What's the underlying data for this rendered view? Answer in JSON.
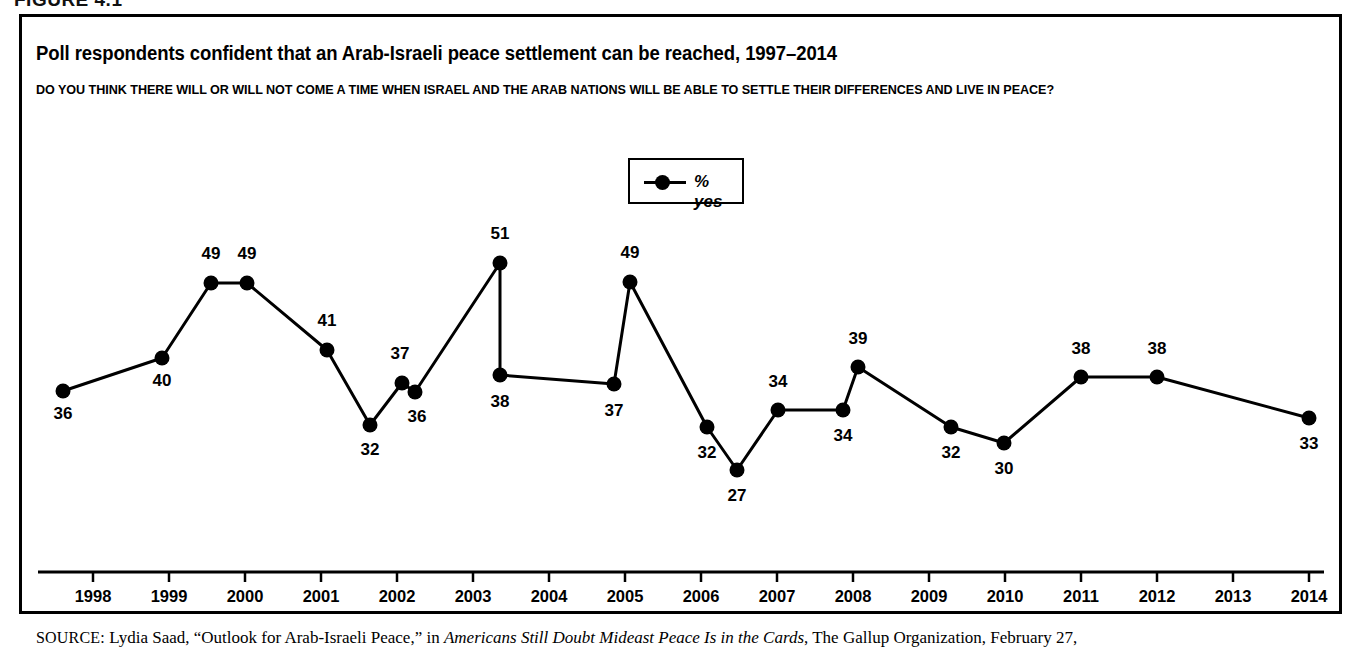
{
  "figure": {
    "caption": "FIGURE 4.1"
  },
  "chart": {
    "title": "Poll respondents confident that an Arab-Israeli peace settlement can be reached, 1997–2014",
    "question": "DO YOU THINK THERE WILL OR WILL NOT COME A TIME WHEN ISRAEL AND THE ARAB NATIONS WILL BE ABLE TO SETTLE THEIR DIFFERENCES AND LIVE IN PEACE?",
    "legend": {
      "label": "% yes",
      "marker": "line-with-dot-marker"
    },
    "colors": {
      "line": "#000000",
      "marker": "#000000",
      "frame": "#000000",
      "background": "#ffffff"
    }
  },
  "source": {
    "label": "SOURCE:",
    "text_before_italic": " Lydia Saad, “Outlook for Arab-Israeli Peace,” in ",
    "italic_text": "Americans Still Doubt Mideast Peace Is in the Cards",
    "text_after_italic": ", The Gallup Organization, February 27,"
  },
  "chart_data": {
    "type": "line",
    "title": "Poll respondents confident that an Arab-Israeli peace settlement can be reached, 1997–2014",
    "subtitle": "DO YOU THINK THERE WILL OR WILL NOT COME A TIME WHEN ISRAEL AND THE ARAB NATIONS WILL BE ABLE TO SETTLE THEIR DIFFERENCES AND LIVE IN PEACE?",
    "xlabel": "",
    "ylabel": "",
    "grid": false,
    "legend_position": "top-center",
    "series": [
      {
        "name": "% yes",
        "values": [
          36,
          40,
          49,
          49,
          41,
          32,
          37,
          36,
          51,
          38,
          37,
          49,
          32,
          27,
          34,
          34,
          39,
          32,
          30,
          38,
          38,
          33
        ]
      }
    ],
    "point_labels": [
      "36",
      "40",
      "49",
      "49",
      "41",
      "32",
      "37",
      "36",
      "51",
      "38",
      "37",
      "49",
      "32",
      "27",
      "34",
      "34",
      "39",
      "32",
      "30",
      "38",
      "38",
      "33"
    ],
    "points": [
      {
        "label": "36",
        "value": 36,
        "x": 63,
        "y": 391,
        "label_dx": 0,
        "label_dy": 22
      },
      {
        "label": "40",
        "value": 40,
        "x": 162,
        "y": 358,
        "label_dx": 0,
        "label_dy": 22
      },
      {
        "label": "49",
        "value": 49,
        "x": 211,
        "y": 283,
        "label_dx": 0,
        "label_dy": -30
      },
      {
        "label": "49",
        "value": 49,
        "x": 247,
        "y": 283,
        "label_dx": 0,
        "label_dy": -30
      },
      {
        "label": "41",
        "value": 41,
        "x": 327,
        "y": 350,
        "label_dx": 0,
        "label_dy": -30
      },
      {
        "label": "32",
        "value": 32,
        "x": 370,
        "y": 425,
        "label_dx": 0,
        "label_dy": 24
      },
      {
        "label": "37",
        "value": 37,
        "x": 402,
        "y": 383,
        "label_dx": -2,
        "label_dy": -30
      },
      {
        "label": "36",
        "value": 36,
        "x": 415,
        "y": 392,
        "label_dx": 2,
        "label_dy": 24
      },
      {
        "label": "51",
        "value": 51,
        "x": 500,
        "y": 263,
        "label_dx": 0,
        "label_dy": -30
      },
      {
        "label": "38",
        "value": 38,
        "x": 500,
        "y": 375,
        "label_dx": 0,
        "label_dy": 26
      },
      {
        "label": "37",
        "value": 37,
        "x": 614,
        "y": 384,
        "label_dx": 0,
        "label_dy": 26
      },
      {
        "label": "49",
        "value": 49,
        "x": 630,
        "y": 282,
        "label_dx": 0,
        "label_dy": -30
      },
      {
        "label": "32",
        "value": 32,
        "x": 707,
        "y": 427,
        "label_dx": 0,
        "label_dy": 25
      },
      {
        "label": "27",
        "value": 27,
        "x": 737,
        "y": 470,
        "label_dx": 0,
        "label_dy": 25
      },
      {
        "label": "34",
        "value": 34,
        "x": 778,
        "y": 410,
        "label_dx": 0,
        "label_dy": -29
      },
      {
        "label": "34",
        "value": 34,
        "x": 843,
        "y": 410,
        "label_dx": 0,
        "label_dy": 25
      },
      {
        "label": "39",
        "value": 39,
        "x": 858,
        "y": 367,
        "label_dx": 0,
        "label_dy": -29
      },
      {
        "label": "32",
        "value": 32,
        "x": 951,
        "y": 427,
        "label_dx": 0,
        "label_dy": 25
      },
      {
        "label": "30",
        "value": 30,
        "x": 1004,
        "y": 443,
        "label_dx": 0,
        "label_dy": 25
      },
      {
        "label": "38",
        "value": 38,
        "x": 1081,
        "y": 377,
        "label_dx": 0,
        "label_dy": -29
      },
      {
        "label": "38",
        "value": 38,
        "x": 1157,
        "y": 377,
        "label_dx": 0,
        "label_dy": -29
      },
      {
        "label": "33",
        "value": 33,
        "x": 1309,
        "y": 418,
        "label_dx": 0,
        "label_dy": 25
      }
    ],
    "x_axis": {
      "tick_labels": [
        "1998",
        "1999",
        "2000",
        "2001",
        "2002",
        "2003",
        "2004",
        "2005",
        "2006",
        "2007",
        "2008",
        "2009",
        "2010",
        "2011",
        "2012",
        "2013",
        "2014"
      ],
      "tick_x": [
        93,
        169,
        245,
        321,
        397,
        473,
        549,
        625,
        701,
        777,
        853,
        929,
        1005,
        1081,
        1157,
        1233,
        1309
      ],
      "axis_y": 572,
      "axis_x_start": 38,
      "axis_x_end": 1324
    },
    "y_axis": {
      "visible": false,
      "value_to_pixel": {
        "reference_value": 49,
        "reference_y": 283,
        "pixels_per_unit": 8.35
      }
    }
  }
}
